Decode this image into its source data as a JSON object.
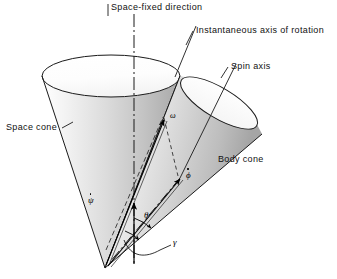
{
  "figure": {
    "background": "#ffffff",
    "line_color": "#1a1a1a",
    "shade_light": "#ffffff",
    "shade_mid": "#d8d8d8",
    "shade_dark": "#9a9a9a"
  },
  "labels": {
    "space_fixed_direction": "Space-fixed direction",
    "instantaneous_axis": "Instantaneous axis of rotation",
    "spin_axis": "Spin axis",
    "space_cone": "Space cone",
    "body_cone": "Body cone"
  },
  "symbols": {
    "omega": "ω",
    "psi_dot_base": "ψ",
    "phi_dot_base": "ϕ",
    "theta": "θ",
    "gamma": "γ"
  },
  "annotations": [
    {
      "name": "omega-vector-label",
      "text": "ω",
      "meaning": "total angular velocity vector"
    },
    {
      "name": "psi-dot-vector-label",
      "text": "ψ̇",
      "meaning": "precession rate about space-fixed axis"
    },
    {
      "name": "phi-dot-vector-label",
      "text": "ϕ̇",
      "meaning": "spin rate about spin axis"
    },
    {
      "name": "theta-angle-label",
      "text": "θ",
      "meaning": "nutation angle between space-fixed direction and spin axis"
    },
    {
      "name": "gamma-angle-label",
      "text": "γ",
      "meaning": "angle between instantaneous axis of rotation and spin axis"
    }
  ],
  "geometry": {
    "apex": {
      "x": 105,
      "y": 268
    },
    "space_cone_rim_center": {
      "x": 111,
      "y": 76
    },
    "space_cone_rim_rx": 69,
    "space_cone_rim_ry": 21,
    "body_cone_rim_center": {
      "x": 219,
      "y": 103
    },
    "body_cone_rim_rx": 44,
    "body_cone_rim_ry": 15,
    "body_cone_rim_rotation_deg": 31
  }
}
